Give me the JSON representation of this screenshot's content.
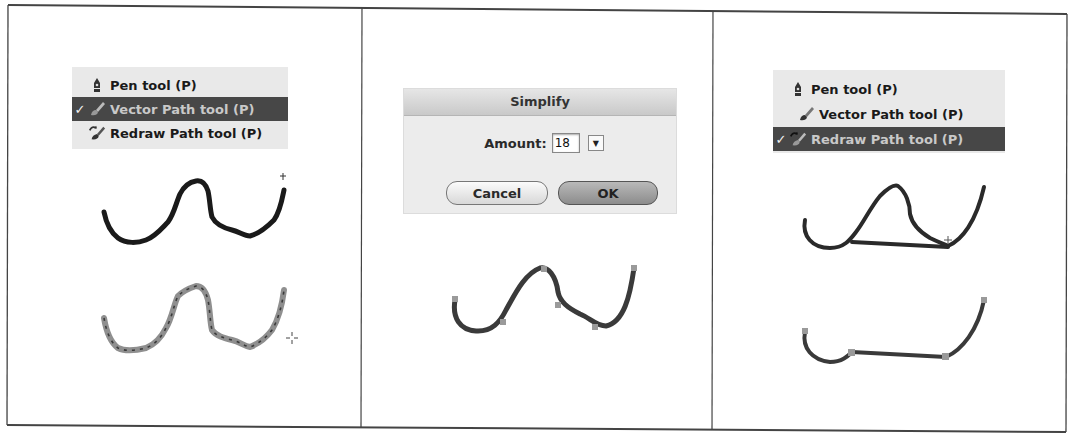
{
  "panels": [
    {
      "id": "step-1",
      "menu": {
        "items": [
          {
            "label": "Pen tool (P)",
            "icon": "pen-nib-icon",
            "selected": false
          },
          {
            "label": "Vector Path tool (P)",
            "icon": "brush-icon",
            "selected": true
          },
          {
            "label": "Redraw Path tool (P)",
            "icon": "redraw-brush-icon",
            "selected": false
          }
        ],
        "check_glyph": "✓"
      },
      "drawings": [
        "raw-freehand-stroke",
        "vector-path-with-nodes"
      ],
      "cursor": "crosshair-cursor"
    },
    {
      "id": "step-2",
      "dialog": {
        "title": "Simplify",
        "amount_label": "Amount:",
        "amount_value": "18",
        "stepper_glyph": "▼",
        "cancel_label": "Cancel",
        "ok_label": "OK"
      },
      "drawings": [
        "simplified-path"
      ]
    },
    {
      "id": "step-3",
      "menu": {
        "items": [
          {
            "label": "Pen tool (P)",
            "icon": "pen-nib-icon",
            "selected": false
          },
          {
            "label": "Vector Path tool (P)",
            "icon": "brush-icon",
            "selected": false
          },
          {
            "label": "Redraw Path tool (P)",
            "icon": "redraw-brush-icon",
            "selected": true
          }
        ],
        "check_glyph": "✓"
      },
      "drawings": [
        "redraw-loop-stroke",
        "redrawn-path"
      ]
    }
  ],
  "colors": {
    "border": "#333333",
    "menu_bg": "#e9e9e9",
    "menu_selected_bg": "#474747",
    "stroke_dark": "#1a1a1a",
    "stroke_path": "#3a3a3a",
    "node_fill": "#9a9a9a"
  }
}
